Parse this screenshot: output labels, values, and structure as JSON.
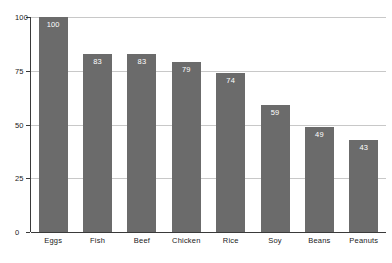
{
  "chart_data": {
    "type": "bar",
    "title": "",
    "subtitle": "",
    "xlabel": "",
    "ylabel": "",
    "categories": [
      "Eggs",
      "Fish",
      "Beef",
      "Chicken",
      "Rice",
      "Soy",
      "Beans",
      "Peanuts"
    ],
    "values": [
      100,
      83,
      83,
      79,
      74,
      59,
      49,
      43
    ],
    "value_labels": [
      "100",
      "83",
      "83",
      "79",
      "74",
      "59",
      "49",
      "43"
    ],
    "ylim": [
      0,
      100
    ],
    "yticks": [
      0,
      25,
      50,
      75,
      100
    ],
    "ytick_labels": [
      "0",
      "25",
      "50",
      "75",
      "100"
    ],
    "grid": "horizontal",
    "legend": "none",
    "orientation": "vertical",
    "colors": {
      "bar": "#6b6b6b",
      "value_label": "#ffffff",
      "gridline": "#c8c8c8",
      "axis": "#3a3a3a",
      "text": "#1a1a1a",
      "background": "#ffffff"
    }
  }
}
